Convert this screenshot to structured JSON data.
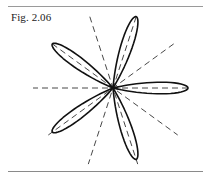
{
  "figure": {
    "label": "Fig. 2.06",
    "curve": {
      "type": "rose",
      "petals": 5,
      "petal_angles_deg": [
        0,
        72,
        144,
        216,
        288
      ],
      "stroke_color": "#111111"
    },
    "axes": {
      "style": "dashed",
      "count": 5,
      "angles_deg": [
        0,
        36,
        72,
        108,
        144
      ],
      "stroke_color": "#333333"
    }
  }
}
